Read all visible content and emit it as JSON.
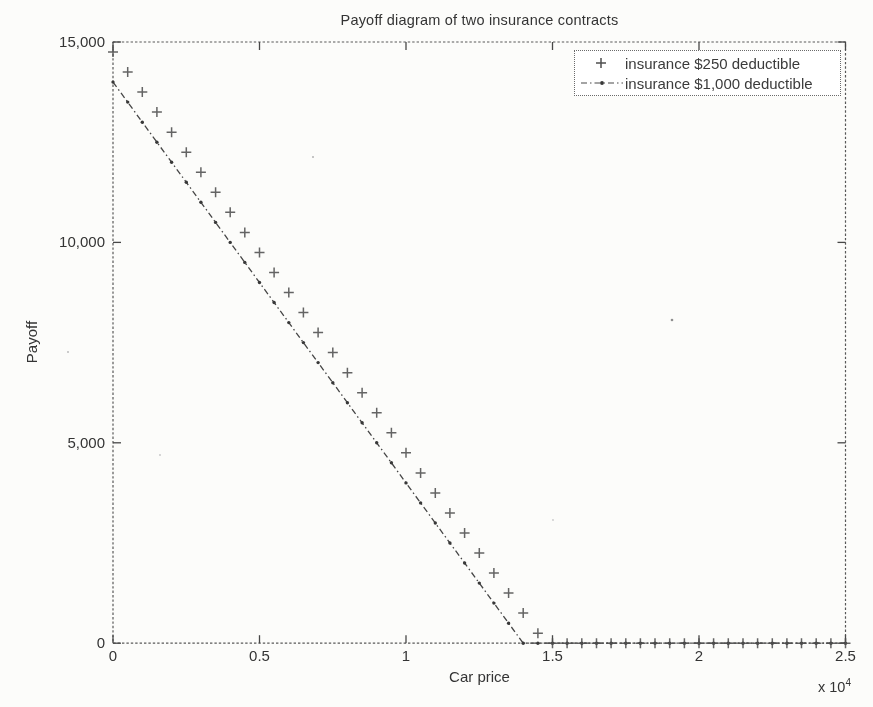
{
  "figure": {
    "background": "#fcfcfa",
    "ink_color": "#4a4a4a"
  },
  "chart_data": {
    "type": "line",
    "title": "Payoff diagram of two insurance contracts",
    "xlabel": "Car price",
    "ylabel": "Payoff",
    "x_axis_multiplier": {
      "label": "x 10",
      "exponent": "4"
    },
    "xlim": [
      0,
      25000
    ],
    "ylim": [
      0,
      15000
    ],
    "grid": false,
    "legend_position": "top-right",
    "xticks": {
      "values": [
        0,
        5000,
        10000,
        15000,
        20000,
        25000
      ],
      "labels": [
        "0",
        "0.5",
        "1",
        "1.5",
        "2",
        "2.5"
      ]
    },
    "yticks": {
      "values": [
        0,
        5000,
        10000,
        15000
      ],
      "labels": [
        "0",
        "5,000",
        "10,000",
        "15,000"
      ]
    },
    "x": [
      0,
      500,
      1000,
      1500,
      2000,
      2500,
      3000,
      3500,
      4000,
      4500,
      5000,
      5500,
      6000,
      6500,
      7000,
      7500,
      8000,
      8500,
      9000,
      9500,
      10000,
      10500,
      11000,
      11500,
      12000,
      12500,
      13000,
      13500,
      14000,
      14500,
      15000,
      15500,
      16000,
      16500,
      17000,
      17500,
      18000,
      18500,
      19000,
      19500,
      20000,
      20500,
      21000,
      21500,
      22000,
      22500,
      23000,
      23500,
      24000,
      24500,
      25000
    ],
    "series": [
      {
        "name": "insurance $250 deductible",
        "marker": "plus",
        "linestyle": "none",
        "color": "#4f4f4f",
        "values": [
          14750,
          14250,
          13750,
          13250,
          12750,
          12250,
          11750,
          11250,
          10750,
          10250,
          9750,
          9250,
          8750,
          8250,
          7750,
          7250,
          6750,
          6250,
          5750,
          5250,
          4750,
          4250,
          3750,
          3250,
          2750,
          2250,
          1750,
          1250,
          750,
          250,
          0,
          0,
          0,
          0,
          0,
          0,
          0,
          0,
          0,
          0,
          0,
          0,
          0,
          0,
          0,
          0,
          0,
          0,
          0,
          0,
          0
        ]
      },
      {
        "name": "insurance $1,000 deductible",
        "marker": "dot",
        "linestyle": "dash-dot",
        "color": "#454545",
        "values": [
          14000,
          13500,
          13000,
          12500,
          12000,
          11500,
          11000,
          10500,
          10000,
          9500,
          9000,
          8500,
          8000,
          7500,
          7000,
          6500,
          6000,
          5500,
          5000,
          4500,
          4000,
          3500,
          3000,
          2500,
          2000,
          1500,
          1000,
          500,
          0,
          0,
          0,
          0,
          0,
          0,
          0,
          0,
          0,
          0,
          0,
          0,
          0,
          0,
          0,
          0,
          0,
          0,
          0,
          0,
          0,
          0,
          0
        ]
      }
    ]
  }
}
